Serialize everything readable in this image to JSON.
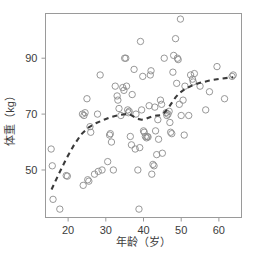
{
  "chart_data": {
    "type": "scatter",
    "title": "",
    "subtitle": "",
    "xlabel": "年龄（岁）",
    "ylabel": "体重（kg）",
    "xlim": [
      14,
      66
    ],
    "ylim": [
      33,
      106
    ],
    "xticks": [
      20,
      30,
      40,
      50,
      60
    ],
    "xtick_labels": [
      "20",
      "30",
      "40",
      "50",
      "60"
    ],
    "yticks": [
      50,
      70,
      90
    ],
    "ytick_labels": [
      "50",
      "70",
      "90"
    ],
    "grid": false,
    "legend": null,
    "marker": {
      "shape": "open-circle",
      "color": "#8c8c8c",
      "size": 3.2
    },
    "series": [
      {
        "name": "体重观测值",
        "type": "scatter",
        "points": [
          [
            15.5,
            57.5
          ],
          [
            15.8,
            51.5
          ],
          [
            16.0,
            39.5
          ],
          [
            17.8,
            36.0
          ],
          [
            19.5,
            48.0
          ],
          [
            19.8,
            47.8
          ],
          [
            23.8,
            70.0
          ],
          [
            24.0,
            44.5
          ],
          [
            24.2,
            69.5
          ],
          [
            24.5,
            70.5
          ],
          [
            25.0,
            75.5
          ],
          [
            25.2,
            46.5
          ],
          [
            25.5,
            46.0
          ],
          [
            25.8,
            65.5
          ],
          [
            26.0,
            63.5
          ],
          [
            27.0,
            48.5
          ],
          [
            27.8,
            70.0
          ],
          [
            28.0,
            49.5
          ],
          [
            28.5,
            84.0
          ],
          [
            29.0,
            50.0
          ],
          [
            30.5,
            53.0
          ],
          [
            31.0,
            62.5
          ],
          [
            31.2,
            63.0
          ],
          [
            31.5,
            60.0
          ],
          [
            32.0,
            50.0
          ],
          [
            32.5,
            80.0
          ],
          [
            33.0,
            76.5
          ],
          [
            33.2,
            75.0
          ],
          [
            33.5,
            72.0
          ],
          [
            34.0,
            69.5
          ],
          [
            34.5,
            79.5
          ],
          [
            34.8,
            78.5
          ],
          [
            35.0,
            90.0
          ],
          [
            35.3,
            90.0
          ],
          [
            35.5,
            80.0
          ],
          [
            35.8,
            71.5
          ],
          [
            36.0,
            70.5
          ],
          [
            36.2,
            71.0
          ],
          [
            36.5,
            62.0
          ],
          [
            36.8,
            59.0
          ],
          [
            37.0,
            77.0
          ],
          [
            37.5,
            86.0
          ],
          [
            37.8,
            57.5
          ],
          [
            38.0,
            70.0
          ],
          [
            38.5,
            50.0
          ],
          [
            38.8,
            36.0
          ],
          [
            39.0,
            58.0
          ],
          [
            39.2,
            96.0
          ],
          [
            39.5,
            71.5
          ],
          [
            39.8,
            83.5
          ],
          [
            40.0,
            64.0
          ],
          [
            40.2,
            63.5
          ],
          [
            40.5,
            62.0
          ],
          [
            40.8,
            61.5
          ],
          [
            41.0,
            62.0
          ],
          [
            41.2,
            61.8
          ],
          [
            41.5,
            73.0
          ],
          [
            41.8,
            84.0
          ],
          [
            42.0,
            85.5
          ],
          [
            42.2,
            48.5
          ],
          [
            42.5,
            52.0
          ],
          [
            42.8,
            51.5
          ],
          [
            43.0,
            72.5
          ],
          [
            43.2,
            64.0
          ],
          [
            43.5,
            55.5
          ],
          [
            43.8,
            68.0
          ],
          [
            44.0,
            61.0
          ],
          [
            44.5,
            75.0
          ],
          [
            44.8,
            73.5
          ],
          [
            45.0,
            56.0
          ],
          [
            45.5,
            90.0
          ],
          [
            46.0,
            70.5
          ],
          [
            46.2,
            69.5
          ],
          [
            46.5,
            70.0
          ],
          [
            46.8,
            71.0
          ],
          [
            47.0,
            67.0
          ],
          [
            47.2,
            63.5
          ],
          [
            47.5,
            63.0
          ],
          [
            47.8,
            85.0
          ],
          [
            48.0,
            91.0
          ],
          [
            48.5,
            97.0
          ],
          [
            48.8,
            81.0
          ],
          [
            49.0,
            90.0
          ],
          [
            49.2,
            89.5
          ],
          [
            49.5,
            73.5
          ],
          [
            49.8,
            104.0
          ],
          [
            50.0,
            69.5
          ],
          [
            50.5,
            75.0
          ],
          [
            50.8,
            62.5
          ],
          [
            51.0,
            80.0
          ],
          [
            52.0,
            69.5
          ],
          [
            52.5,
            84.0
          ],
          [
            53.0,
            82.5
          ],
          [
            53.2,
            81.5
          ],
          [
            53.5,
            84.5
          ],
          [
            55.0,
            80.0
          ],
          [
            56.5,
            71.5
          ],
          [
            57.5,
            78.0
          ],
          [
            59.5,
            87.0
          ],
          [
            61.5,
            75.5
          ],
          [
            63.5,
            83.5
          ],
          [
            63.8,
            84.0
          ]
        ]
      },
      {
        "name": "平滑曲线",
        "type": "line",
        "style": "dashed",
        "color": "#3a3a3a",
        "points": [
          [
            15.6,
            43.0
          ],
          [
            17.5,
            48.5
          ],
          [
            19.5,
            54.0
          ],
          [
            21.5,
            58.8
          ],
          [
            23.5,
            62.8
          ],
          [
            25.5,
            65.3
          ],
          [
            27.5,
            66.8
          ],
          [
            29.5,
            68.0
          ],
          [
            31.5,
            69.0
          ],
          [
            33.5,
            69.7
          ],
          [
            35.5,
            70.0
          ],
          [
            36.5,
            69.8
          ],
          [
            37.5,
            69.0
          ],
          [
            38.5,
            68.3
          ],
          [
            39.5,
            68.0
          ],
          [
            40.5,
            68.2
          ],
          [
            41.5,
            68.8
          ],
          [
            42.5,
            69.3
          ],
          [
            43.5,
            69.5
          ],
          [
            44.5,
            69.6
          ],
          [
            45.5,
            70.5
          ],
          [
            46.5,
            72.0
          ],
          [
            47.5,
            74.0
          ],
          [
            48.5,
            76.0
          ],
          [
            49.5,
            77.5
          ],
          [
            51.0,
            79.0
          ],
          [
            53.0,
            80.3
          ],
          [
            55.0,
            81.2
          ],
          [
            57.5,
            82.0
          ],
          [
            60.0,
            82.6
          ],
          [
            62.5,
            83.0
          ],
          [
            63.8,
            83.2
          ]
        ]
      }
    ]
  },
  "colors": {
    "marker_stroke": "#8c8c8c",
    "curve": "#3a3a3a",
    "frame": "#9a9a9a",
    "text": "#3c3c3c",
    "background": "#ffffff"
  }
}
